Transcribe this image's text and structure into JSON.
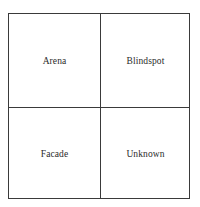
{
  "diagram": {
    "type": "2x2 quadrant grid",
    "quadrants": [
      {
        "position": "top-left",
        "label": "Arena"
      },
      {
        "position": "top-right",
        "label": "Blindspot"
      },
      {
        "position": "bottom-left",
        "label": "Facade"
      },
      {
        "position": "bottom-right",
        "label": "Unknown"
      }
    ],
    "colors": {
      "line": "#3a3a3a",
      "text": "#2a2a2a",
      "background": "#ffffff"
    }
  }
}
